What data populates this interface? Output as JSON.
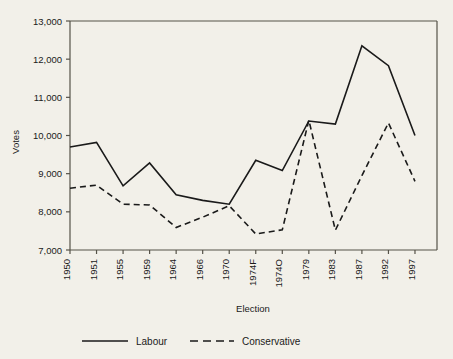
{
  "chart_data": {
    "type": "line",
    "title": "",
    "xlabel": "Election",
    "ylabel": "Votes",
    "grid": false,
    "legend_position": "bottom",
    "categories": [
      "1950",
      "1951",
      "1955",
      "1959",
      "1964",
      "1966",
      "1970",
      "1974F",
      "1974O",
      "1979",
      "1983",
      "1987",
      "1992",
      "1997"
    ],
    "ylim": [
      7000,
      13000
    ],
    "ytick_labels": [
      "7,000",
      "8,000",
      "9,000",
      "10,000",
      "11,000",
      "12,000",
      "13,000"
    ],
    "yticks": [
      7000,
      8000,
      9000,
      10000,
      11000,
      12000,
      13000
    ],
    "series": [
      {
        "name": "Labour",
        "style": "solid",
        "color": "#1a1a1a",
        "values": [
          9700,
          9820,
          8680,
          9280,
          8450,
          8300,
          8200,
          9350,
          9080,
          10380,
          10300,
          12350,
          11830,
          10000
        ]
      },
      {
        "name": "Conservative",
        "style": "dashed",
        "color": "#1a1a1a",
        "values": [
          8620,
          8700,
          8200,
          8180,
          7590,
          7860,
          8160,
          7420,
          7530,
          10400,
          7520,
          8950,
          10330,
          8800
        ]
      }
    ]
  },
  "colors": {
    "background": "#f2f0e9",
    "axis": "#555248",
    "ink": "#1a1a1a"
  }
}
